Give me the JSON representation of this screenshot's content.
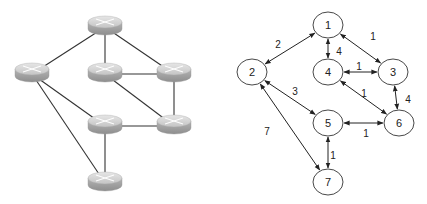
{
  "left_diagram": {
    "title": "Physical router network",
    "icon": "router-icon",
    "routers": [
      {
        "id": "top",
        "x": 105,
        "y": 25
      },
      {
        "id": "left",
        "x": 32,
        "y": 72
      },
      {
        "id": "mid",
        "x": 105,
        "y": 72
      },
      {
        "id": "right",
        "x": 174,
        "y": 72
      },
      {
        "id": "lowmid",
        "x": 105,
        "y": 124
      },
      {
        "id": "lowright",
        "x": 174,
        "y": 124
      },
      {
        "id": "bottom",
        "x": 105,
        "y": 181
      }
    ],
    "links": [
      [
        "top",
        "left"
      ],
      [
        "top",
        "mid"
      ],
      [
        "top",
        "right"
      ],
      [
        "mid",
        "right"
      ],
      [
        "mid",
        "lowright"
      ],
      [
        "right",
        "lowright"
      ],
      [
        "left",
        "lowmid"
      ],
      [
        "left",
        "bottom"
      ],
      [
        "lowmid",
        "lowright"
      ],
      [
        "lowmid",
        "bottom"
      ]
    ]
  },
  "right_diagram": {
    "title": "Weighted graph",
    "nodes": [
      {
        "id": "1",
        "label": "1",
        "x": 328,
        "y": 25
      },
      {
        "id": "2",
        "label": "2",
        "x": 252,
        "y": 72
      },
      {
        "id": "4",
        "label": "4",
        "x": 328,
        "y": 72
      },
      {
        "id": "3",
        "label": "3",
        "x": 393,
        "y": 72
      },
      {
        "id": "5",
        "label": "5",
        "x": 328,
        "y": 123
      },
      {
        "id": "6",
        "label": "6",
        "x": 399,
        "y": 123
      },
      {
        "id": "7",
        "label": "7",
        "x": 328,
        "y": 182
      }
    ],
    "edges": [
      {
        "from": "1",
        "to": "2",
        "weight": "2",
        "label_x": 278,
        "label_y": 48
      },
      {
        "from": "1",
        "to": "4",
        "weight": "4",
        "label_x": 339,
        "label_y": 55
      },
      {
        "from": "1",
        "to": "3",
        "weight": "1",
        "label_x": 373,
        "label_y": 40
      },
      {
        "from": "4",
        "to": "3",
        "weight": "1",
        "label_x": 359,
        "label_y": 70
      },
      {
        "from": "4",
        "to": "6",
        "weight": "1",
        "label_x": 364,
        "label_y": 97
      },
      {
        "from": "3",
        "to": "6",
        "weight": "4",
        "label_x": 408,
        "label_y": 103
      },
      {
        "from": "2",
        "to": "5",
        "weight": "3",
        "label_x": 295,
        "label_y": 95
      },
      {
        "from": "5",
        "to": "6",
        "weight": "1",
        "label_x": 366,
        "label_y": 137
      },
      {
        "from": "2",
        "to": "7",
        "weight": "7",
        "label_x": 267,
        "label_y": 135
      },
      {
        "from": "5",
        "to": "7",
        "weight": "1",
        "label_x": 333,
        "label_y": 159
      }
    ]
  }
}
